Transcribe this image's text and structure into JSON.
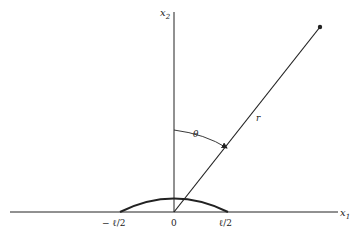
{
  "diagram": {
    "axes": {
      "horizontal_label": "x",
      "horizontal_subscript": "1",
      "vertical_label": "x",
      "vertical_subscript": "2"
    },
    "origin_label": "0",
    "tick_labels": {
      "left": "− ℓ/2",
      "right": "ℓ/2"
    },
    "radius_label": "r",
    "angle_label": "θ",
    "colors": {
      "line": "#222222",
      "background": "#ffffff"
    }
  }
}
